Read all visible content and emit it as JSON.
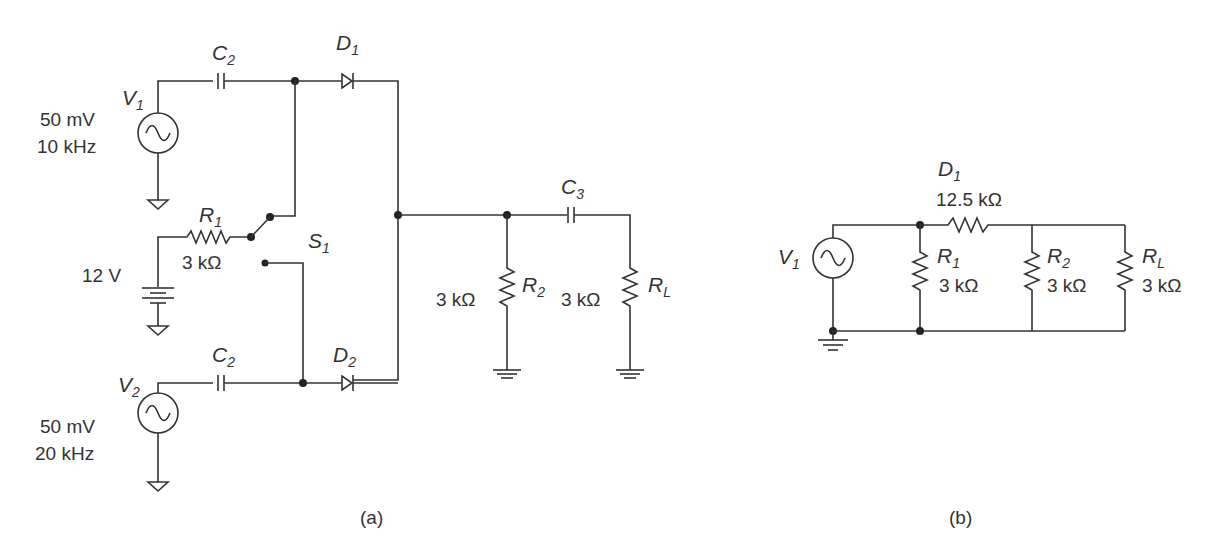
{
  "figure_a": {
    "caption": "(a)",
    "sources": [
      {
        "name": "V",
        "sub": "1",
        "amplitude": "50 mV",
        "frequency": "10 kHz"
      },
      {
        "name": "V",
        "sub": "2",
        "amplitude": "50 mV",
        "frequency": "20 kHz"
      }
    ],
    "capacitors": [
      {
        "name": "C",
        "sub": "2"
      },
      {
        "name": "C",
        "sub": "2"
      },
      {
        "name": "C",
        "sub": "3"
      }
    ],
    "diodes": [
      {
        "name": "D",
        "sub": "1"
      },
      {
        "name": "D",
        "sub": "2"
      }
    ],
    "resistors": [
      {
        "name": "R",
        "sub": "1",
        "value": "3 kΩ"
      },
      {
        "name": "R",
        "sub": "2",
        "value": "3 kΩ"
      },
      {
        "name": "R",
        "sub": "L",
        "value": "3 kΩ"
      }
    ],
    "battery": {
      "value": "12 V"
    },
    "switch": {
      "name": "S",
      "sub": "1"
    }
  },
  "figure_b": {
    "caption": "(b)",
    "source": {
      "name": "V",
      "sub": "1"
    },
    "series_element": {
      "name": "D",
      "sub": "1",
      "value": "12.5 kΩ"
    },
    "resistors": [
      {
        "name": "R",
        "sub": "1",
        "value": "3 kΩ"
      },
      {
        "name": "R",
        "sub": "2",
        "value": "3 kΩ"
      },
      {
        "name": "R",
        "sub": "L",
        "value": "3 kΩ"
      }
    ]
  }
}
